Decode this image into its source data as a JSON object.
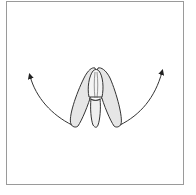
{
  "diagram": {
    "type": "line-art illustration",
    "colors": {
      "background": "#ffffff",
      "frame": "#9a9a9a",
      "stroke": "#333333",
      "petal_fill": "#e6e6e6",
      "center_fill": "#f4f4f4"
    },
    "elements": [
      {
        "name": "left-petal",
        "shape": "elongated teardrop"
      },
      {
        "name": "right-petal",
        "shape": "elongated teardrop"
      },
      {
        "name": "center-petal",
        "shape": "narrow upright oval"
      },
      {
        "name": "left-arrow",
        "direction": "curving up-left"
      },
      {
        "name": "right-arrow",
        "direction": "curving up-right"
      }
    ]
  }
}
